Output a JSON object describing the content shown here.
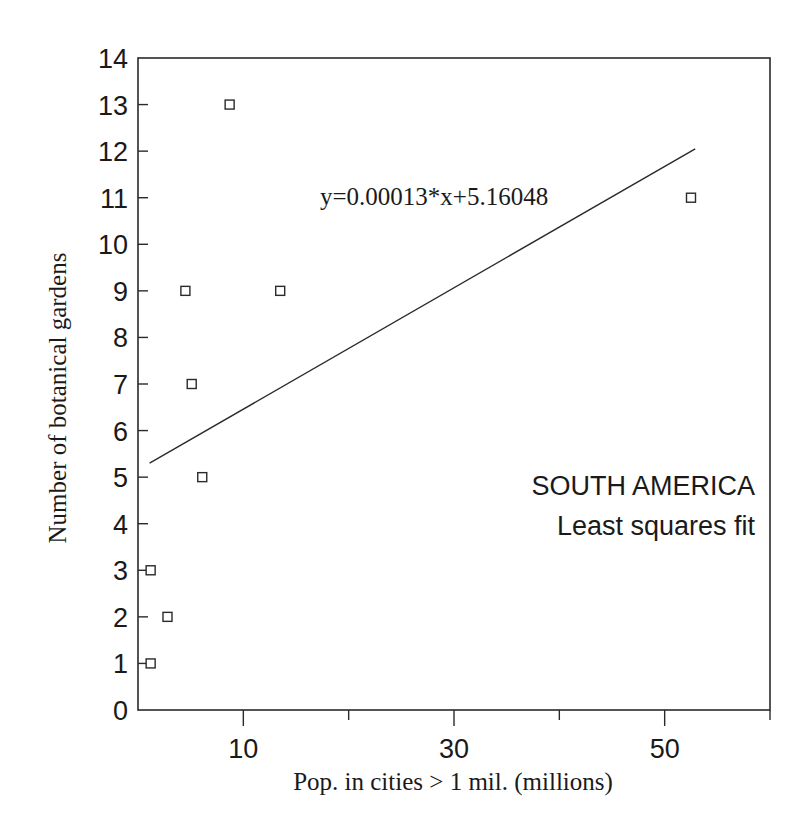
{
  "chart_data": {
    "type": "scatter",
    "title": "",
    "xlabel": "Pop. in cities > 1 mil. (millions)",
    "ylabel": "Number of botanical gardens",
    "xlim": [
      0,
      60
    ],
    "ylim": [
      0,
      14
    ],
    "x_ticks": [
      10,
      20,
      30,
      40,
      50,
      60
    ],
    "x_tick_labels": [
      "10",
      "",
      "30",
      "",
      "50",
      ""
    ],
    "y_ticks": [
      0,
      1,
      2,
      3,
      4,
      5,
      6,
      7,
      8,
      9,
      10,
      11,
      12,
      13,
      14
    ],
    "y_tick_labels": [
      "0",
      "1",
      "2",
      "3",
      "4",
      "5",
      "6",
      "7",
      "8",
      "9",
      "10",
      "11",
      "12",
      "13",
      "14"
    ],
    "grid": false,
    "legend": null,
    "marker": "open-square",
    "series": [
      {
        "name": "South America countries",
        "points": [
          {
            "x": 1.2,
            "y": 1
          },
          {
            "x": 1.2,
            "y": 3
          },
          {
            "x": 2.8,
            "y": 2
          },
          {
            "x": 4.5,
            "y": 9
          },
          {
            "x": 5.1,
            "y": 7
          },
          {
            "x": 6.1,
            "y": 5
          },
          {
            "x": 8.7,
            "y": 13
          },
          {
            "x": 13.5,
            "y": 9
          },
          {
            "x": 52.5,
            "y": 11
          }
        ]
      }
    ],
    "fit_line": {
      "label": "y=0.00013*x+5.16048",
      "x_start": 1.1,
      "y_start": 5.3,
      "x_end": 52.9,
      "y_end": 12.05
    },
    "annotations": [
      "y=0.00013*x+5.16048",
      "SOUTH AMERICA",
      "Least squares fit"
    ]
  },
  "labels": {
    "equation": "y=0.00013*x+5.16048",
    "region": "SOUTH AMERICA",
    "method": "Least squares fit",
    "xlabel": "Pop. in cities > 1 mil. (millions)",
    "ylabel": "Number of botanical gardens"
  },
  "colors": {
    "ink": "#1a1a1a",
    "background": "#ffffff"
  }
}
